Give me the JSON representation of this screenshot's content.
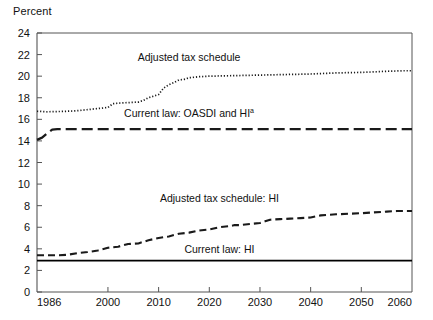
{
  "chart_data": {
    "type": "line",
    "title": "",
    "xlabel": "",
    "ylabel": "Percent",
    "xlim": [
      1986,
      2060
    ],
    "ylim": [
      0,
      24
    ],
    "grid": false,
    "legend_position": "inline-annotations",
    "xticks": [
      "1986",
      "2000",
      "2010",
      "2020",
      "2030",
      "2040",
      "2050",
      "2060"
    ],
    "xtick_values": [
      1986,
      2000,
      2010,
      2020,
      2030,
      2040,
      2050,
      2060
    ],
    "yticks": [
      "0",
      "2",
      "4",
      "6",
      "8",
      "10",
      "12",
      "14",
      "16",
      "18",
      "20",
      "22",
      "24"
    ],
    "ytick_values": [
      0,
      2,
      4,
      6,
      8,
      10,
      12,
      14,
      16,
      18,
      20,
      22,
      24
    ],
    "annotations": [
      {
        "text": "Adjusted tax schedule",
        "x": 2016,
        "y": 21.4
      },
      {
        "text": "Current law: OASDI and HI",
        "superscript": "a",
        "x": 2016,
        "y": 16.2
      },
      {
        "text": "Adjusted tax schedule: HI",
        "x": 2022,
        "y": 8.3
      },
      {
        "text": "Current law: HI",
        "x": 2022,
        "y": 3.6
      }
    ],
    "series": [
      {
        "name": "Adjusted tax schedule",
        "style": "dotted",
        "color": "#1a1a1a",
        "x": [
          1986,
          1988,
          1990,
          1992,
          1994,
          1996,
          1998,
          2000,
          2001,
          2002,
          2004,
          2006,
          2007,
          2008,
          2009,
          2010,
          2011,
          2012,
          2013,
          2014,
          2015,
          2016,
          2018,
          2020,
          2025,
          2030,
          2035,
          2040,
          2045,
          2050,
          2055,
          2058,
          2060
        ],
        "values": [
          16.75,
          16.7,
          16.72,
          16.75,
          16.8,
          16.9,
          17.0,
          17.1,
          17.45,
          17.5,
          17.55,
          17.6,
          17.75,
          18.0,
          18.15,
          18.3,
          18.9,
          19.2,
          19.4,
          19.65,
          19.7,
          19.85,
          19.95,
          20.0,
          20.05,
          20.1,
          20.15,
          20.2,
          20.3,
          20.35,
          20.45,
          20.5,
          20.5
        ]
      },
      {
        "name": "Current law: OASDI and HI",
        "style": "dashed-long",
        "color": "#1a1a1a",
        "x": [
          1986,
          1987,
          1988,
          1989,
          1990,
          2000,
          2020,
          2040,
          2060
        ],
        "values": [
          14.1,
          14.3,
          14.7,
          15.05,
          15.1,
          15.1,
          15.1,
          15.1,
          15.1
        ]
      },
      {
        "name": "Adjusted tax schedule: HI",
        "style": "dashed",
        "color": "#1a1a1a",
        "x": [
          1986,
          1988,
          1990,
          1992,
          1994,
          1996,
          1998,
          2000,
          2002,
          2004,
          2006,
          2008,
          2010,
          2012,
          2014,
          2016,
          2018,
          2020,
          2022,
          2024,
          2025,
          2026,
          2028,
          2030,
          2031,
          2032,
          2034,
          2036,
          2038,
          2040,
          2042,
          2045,
          2050,
          2055,
          2057,
          2060
        ],
        "values": [
          3.4,
          3.4,
          3.4,
          3.45,
          3.6,
          3.7,
          3.85,
          4.1,
          4.2,
          4.45,
          4.5,
          4.8,
          5.0,
          5.15,
          5.4,
          5.5,
          5.7,
          5.8,
          6.0,
          6.1,
          6.2,
          6.2,
          6.3,
          6.4,
          6.55,
          6.7,
          6.75,
          6.8,
          6.85,
          6.9,
          7.1,
          7.2,
          7.3,
          7.45,
          7.5,
          7.5
        ]
      },
      {
        "name": "Current law: HI",
        "style": "solid",
        "color": "#000000",
        "x": [
          1986,
          2060
        ],
        "values": [
          2.9,
          2.9
        ]
      }
    ]
  }
}
